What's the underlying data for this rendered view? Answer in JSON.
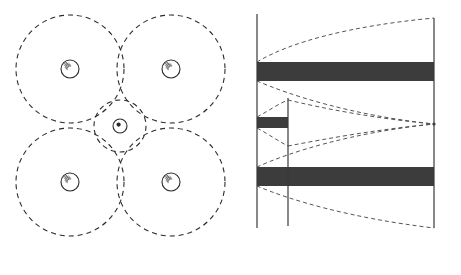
{
  "figure": {
    "title": "",
    "panels": [
      "sphere-packing-diagram",
      "space-time-band-diagram"
    ]
  },
  "left_panel": {
    "name": "sphere-packing-diagram",
    "description": "Four large dashed circles in a 2x2 arrangement with a small dashed circle in the interstitial center",
    "large_circles": [
      {
        "cx": 70,
        "cy": 69,
        "r": 54,
        "core_r": 9
      },
      {
        "cx": 171,
        "cy": 69,
        "r": 54,
        "core_r": 9
      },
      {
        "cx": 70,
        "cy": 182,
        "r": 54,
        "core_r": 9
      },
      {
        "cx": 171,
        "cy": 182,
        "r": 54,
        "core_r": 9
      }
    ],
    "center_circle": {
      "cx": 120,
      "cy": 126,
      "r": 26,
      "core_r": 7
    },
    "stroke_color": "#2b2b2b",
    "dash_pattern": "5 4"
  },
  "right_panel": {
    "name": "space-time-band-diagram",
    "axis_color": "#3a3a3a",
    "curve_color": "#555555",
    "band_color": "#3c3c3c",
    "axes": {
      "left_x": 27,
      "t1_x": 58,
      "right_x": 204,
      "top_y": 18,
      "bottom_y": 228
    },
    "bands": [
      {
        "name": "upper-band",
        "x0": 27,
        "x1": 204,
        "y0": 62,
        "y1": 81
      },
      {
        "name": "middle-band",
        "x0": 27,
        "x1": 58,
        "y0": 117,
        "y1": 128
      },
      {
        "name": "lower-band",
        "x0": 27,
        "x1": 204,
        "y0": 167,
        "y1": 186
      }
    ],
    "convergence_point": {
      "x": 204,
      "y": 124
    },
    "labels": {
      "t_zero": "t = 0",
      "t_one_base": "t",
      "t_one_sub": "1",
      "t_max_base": "t",
      "t_max_sub": "0",
      "equals": "=",
      "numerator_base": "L",
      "numerator_sub": "0",
      "denominator": "V"
    }
  }
}
